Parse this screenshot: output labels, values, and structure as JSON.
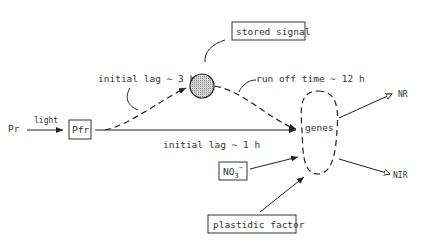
{
  "diagram": {
    "nodes": {
      "pr": {
        "label": "Pr"
      },
      "light": {
        "label": "light"
      },
      "pfr": {
        "label": "Pfr"
      },
      "stored_signal": {
        "label": "stored signal"
      },
      "genes": {
        "label": "genes"
      },
      "no3": {
        "label": "NO",
        "subscript": "3",
        "superscript": "−"
      },
      "plastidic_factor": {
        "label": "plastidic factor"
      },
      "nr": {
        "label": "NR"
      },
      "nir": {
        "label": "NIR"
      }
    },
    "annotations": {
      "initial_lag_3h": "initial lag ∼ 3 h",
      "run_off_time": "run off time ∼ 12 h",
      "initial_lag_1h": "initial lag ∼ 1 h"
    },
    "colors": {
      "stroke": "#222222",
      "text": "#333333",
      "signal_fill": "#bdbdbd",
      "background": "#ffffff"
    }
  }
}
